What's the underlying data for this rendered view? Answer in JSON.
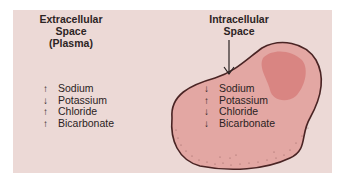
{
  "colors": {
    "panel_bg": "#ecd9d6",
    "cell_fill": "#e3a7a3",
    "cell_outline": "#4a2424",
    "nucleus_fill": "#d77f7c",
    "text": "#2a2222"
  },
  "extracellular": {
    "heading_line1": "Extracellular",
    "heading_line2": "Space",
    "heading_line3": "(Plasma)",
    "ions": [
      {
        "arrow": "↑",
        "direction": "up",
        "name": "Sodium"
      },
      {
        "arrow": "↓",
        "direction": "down",
        "name": "Potassium"
      },
      {
        "arrow": "↑",
        "direction": "up",
        "name": "Chloride"
      },
      {
        "arrow": "↑",
        "direction": "up",
        "name": "Bicarbonate"
      }
    ]
  },
  "intracellular": {
    "heading_line1": "Intracellular",
    "heading_line2": "Space",
    "pointer_icon": "down-arrow",
    "ions": [
      {
        "arrow": "↓",
        "direction": "down",
        "name": "Sodium"
      },
      {
        "arrow": "↑",
        "direction": "up",
        "name": "Potassium"
      },
      {
        "arrow": "↓",
        "direction": "down",
        "name": "Chloride"
      },
      {
        "arrow": "↓",
        "direction": "down",
        "name": "Bicarbonate"
      }
    ]
  }
}
